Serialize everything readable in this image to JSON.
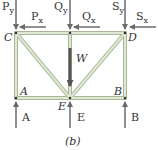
{
  "diagram": {
    "caption": "(b)",
    "colors": {
      "member_fill": "#d9e3c9",
      "member_edge": "#a8b79a",
      "arrow": "#6b6b6b",
      "weight_arrow": "#555555",
      "text": "#333333"
    },
    "joints": [
      {
        "id": "C",
        "label": "C"
      },
      {
        "id": "D",
        "label": "D"
      },
      {
        "id": "A",
        "label": "A"
      },
      {
        "id": "B",
        "label": "B"
      },
      {
        "id": "E",
        "label": "E"
      }
    ],
    "forces": {
      "Py": {
        "base": "P",
        "sub": "y"
      },
      "Px": {
        "base": "P",
        "sub": "x"
      },
      "Qy": {
        "base": "Q",
        "sub": "y"
      },
      "Qx": {
        "base": "Q",
        "sub": "x"
      },
      "Sy": {
        "base": "S",
        "sub": "y"
      },
      "Sx": {
        "base": "S",
        "sub": "x"
      },
      "W": {
        "label": "W"
      },
      "A_reaction": {
        "label": "A"
      },
      "E_reaction": {
        "label": "E"
      },
      "B_reaction": {
        "label": "B"
      }
    }
  }
}
